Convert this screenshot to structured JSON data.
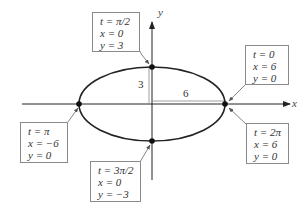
{
  "axes": {
    "x_label": "x",
    "y_label": "y"
  },
  "dimensions": {
    "semi_minor": "3",
    "semi_major": "6"
  },
  "curve": {
    "type": "ellipse",
    "equation_params": {
      "a": 6,
      "b": 3
    },
    "color": "#222222"
  },
  "annotations": [
    {
      "id": "top",
      "t": "t = π/2",
      "x": "x = 0",
      "y": "y = 3"
    },
    {
      "id": "right0",
      "t": "t = 0",
      "x": "x = 6",
      "y": "y = 0"
    },
    {
      "id": "left",
      "t": "t = π",
      "x": "x = −6",
      "y": "y = 0"
    },
    {
      "id": "bottom",
      "t": "t = 3π/2",
      "x": "x = 0",
      "y": "y = −3"
    },
    {
      "id": "right2",
      "t": "t = 2π",
      "x": "x = 6",
      "y": "y = 0"
    }
  ]
}
